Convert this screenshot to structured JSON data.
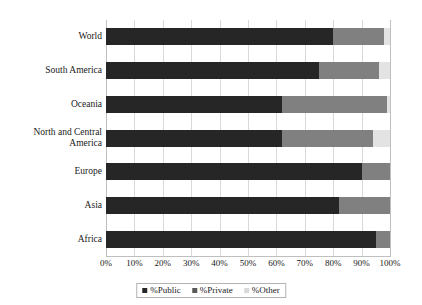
{
  "chart_data": {
    "type": "bar",
    "orientation": "horizontal",
    "stacked": true,
    "title": "",
    "xlabel": "",
    "ylabel": "",
    "xlim": [
      0,
      100
    ],
    "xticks": [
      "0%",
      "10%",
      "20%",
      "30%",
      "40%",
      "50%",
      "60%",
      "70%",
      "80%",
      "90%",
      "100%"
    ],
    "xtick_values": [
      0,
      10,
      20,
      30,
      40,
      50,
      60,
      70,
      80,
      90,
      100
    ],
    "grid": "vertical",
    "legend_position": "bottom",
    "categories": [
      "World",
      "South America",
      "Oceania",
      "North and Central America",
      "Europe",
      "Asia",
      "Africa"
    ],
    "series": [
      {
        "name": "%Public",
        "color": "#262626",
        "values": [
          80,
          75,
          62,
          62,
          90,
          82,
          95
        ]
      },
      {
        "name": "%Private",
        "color": "#808080",
        "values": [
          18,
          21,
          37,
          32,
          10,
          18,
          5
        ]
      },
      {
        "name": "%Other",
        "color": "#e3e3e3",
        "values": [
          2,
          4,
          1,
          6,
          0,
          0,
          0
        ]
      }
    ]
  },
  "legend": {
    "items": [
      {
        "label": "%Public",
        "swatch": "square-dark-icon"
      },
      {
        "label": "%Private",
        "swatch": "square-gray-icon"
      },
      {
        "label": "%Other",
        "swatch": "square-light-icon"
      }
    ]
  },
  "colors": {
    "public": "#262626",
    "private": "#808080",
    "other": "#e3e3e3",
    "grid": "#d9d9d9",
    "axis": "#bfbfbf",
    "text": "#1a1a1a",
    "background": "#ffffff"
  }
}
